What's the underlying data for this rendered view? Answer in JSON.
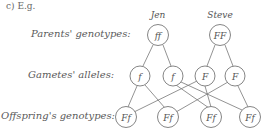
{
  "heading": "c) E.g.",
  "row_labels": {
    "parents": "Parents' genotypes:",
    "gametes": "Gametes' alleles:",
    "offspring": "Offspring's genotypes:"
  },
  "parents": [
    {
      "name": "Jen",
      "genotype": "ff"
    },
    {
      "name": "Steve",
      "genotype": "FF"
    }
  ],
  "gametes": [
    "f",
    "f",
    "F",
    "F"
  ],
  "offspring": [
    "Ff",
    "Ff",
    "Ff",
    "Ff"
  ]
}
